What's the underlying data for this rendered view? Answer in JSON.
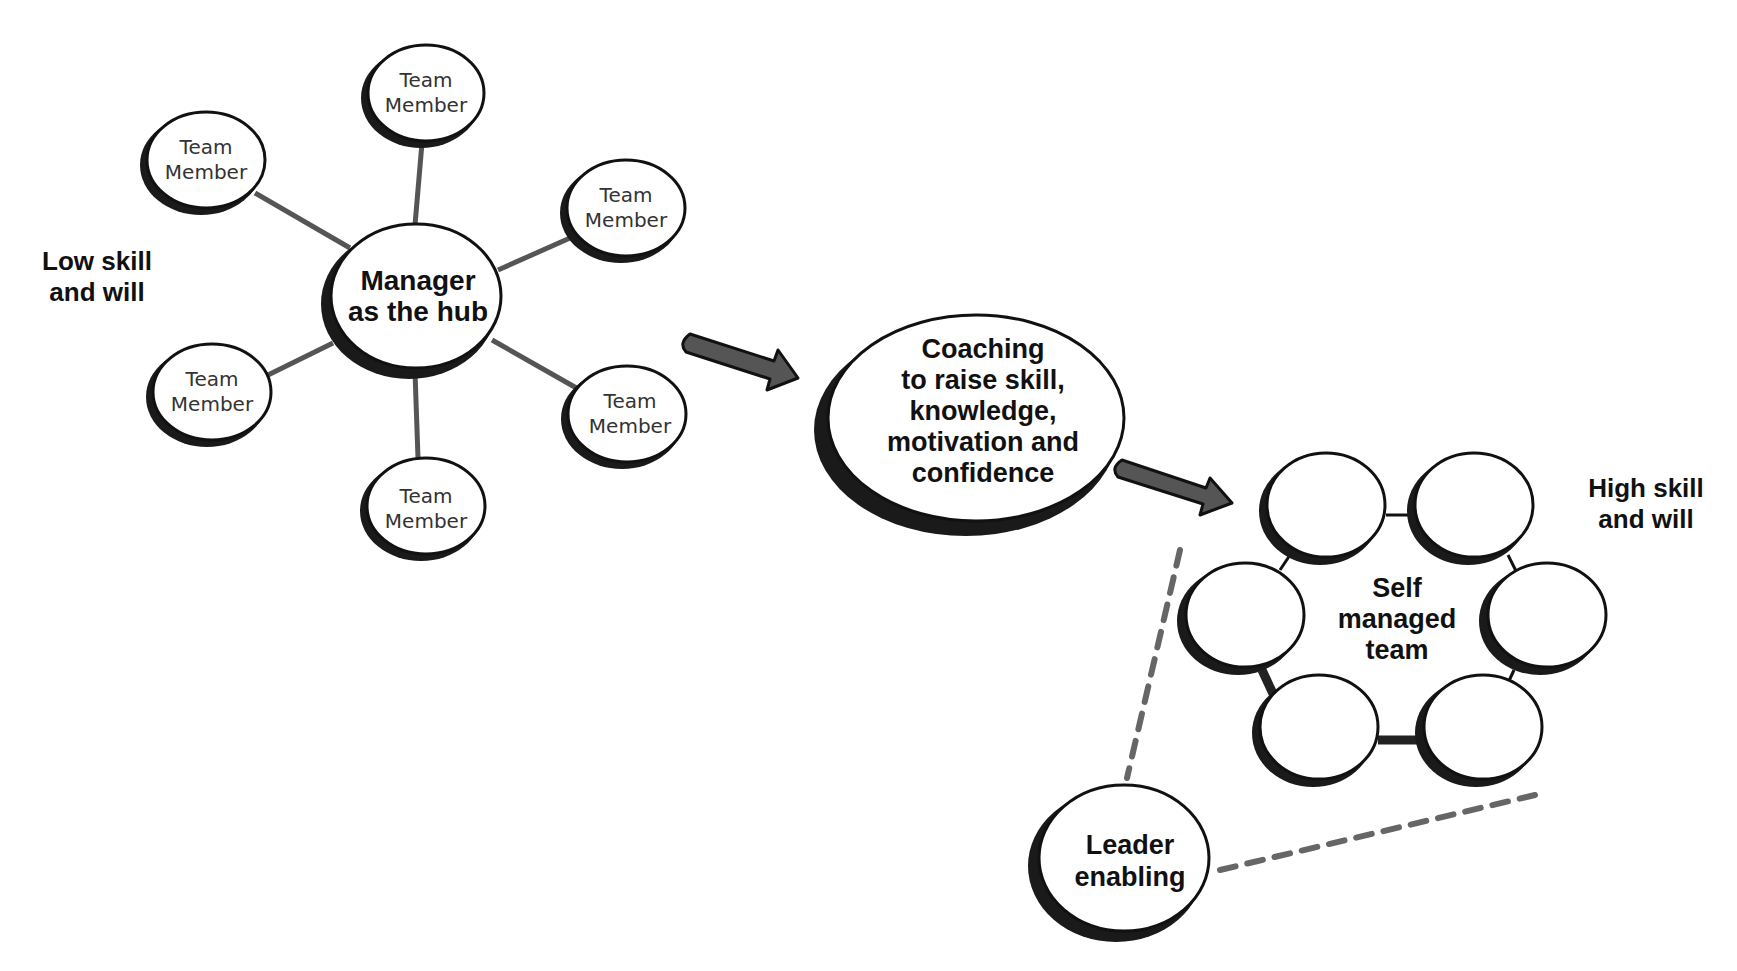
{
  "diagram": {
    "left_label": {
      "line1": "Low skill",
      "line2": "and will"
    },
    "right_label": {
      "line1": "High skill",
      "line2": "and will"
    },
    "hub": {
      "line1": "Manager",
      "line2": "as the hub"
    },
    "team_members": [
      {
        "line1": "Team",
        "line2": "Member",
        "position": "top"
      },
      {
        "line1": "Team",
        "line2": "Member",
        "position": "upper-left"
      },
      {
        "line1": "Team",
        "line2": "Member",
        "position": "upper-right"
      },
      {
        "line1": "Team",
        "line2": "Member",
        "position": "lower-left"
      },
      {
        "line1": "Team",
        "line2": "Member",
        "position": "lower-right"
      },
      {
        "line1": "Team",
        "line2": "Member",
        "position": "bottom"
      }
    ],
    "coaching": {
      "lines": [
        "Coaching",
        "to raise skill,",
        "knowledge,",
        "motivation and",
        "confidence"
      ]
    },
    "self_managed_team": {
      "lines": [
        "Self",
        "managed",
        "team"
      ],
      "member_count": 6
    },
    "leader": {
      "line1": "Leader",
      "line2": "enabling"
    },
    "colors": {
      "outline": "#111111",
      "spoke": "#555555",
      "arrow_fill": "#555555",
      "dash": "#666666",
      "member_text": "#333333",
      "bold_text": "#111111"
    }
  }
}
